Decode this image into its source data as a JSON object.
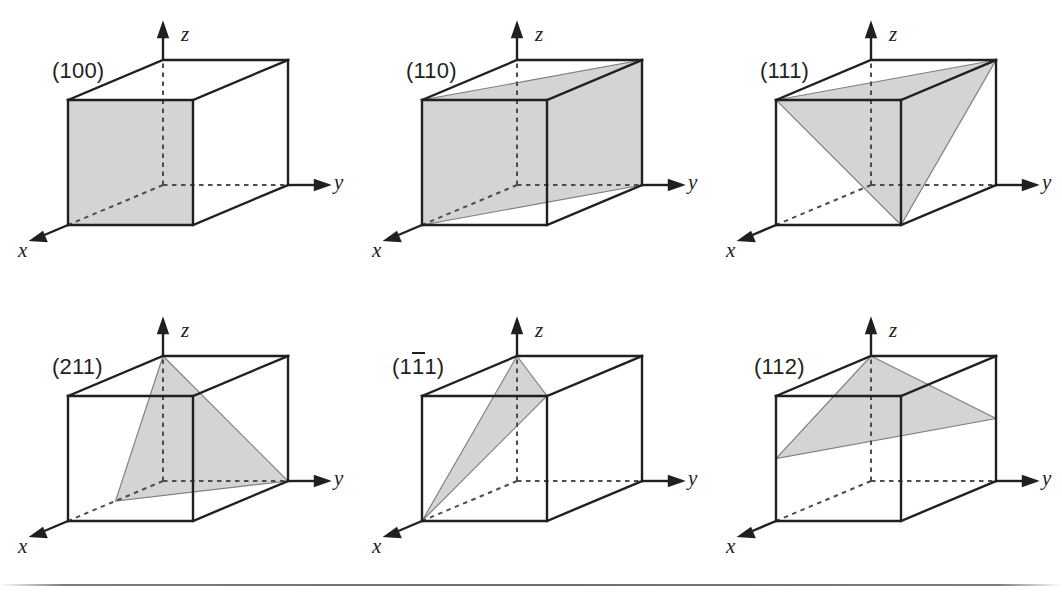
{
  "figure": {
    "geometry": {
      "cube_edge_px": 125,
      "depth_dx_px": 95,
      "depth_dy_px": -40,
      "line_color": "#231f20",
      "plane_fill": "#d4d4d4",
      "plane_stroke": "#808080",
      "dash_color": "#4d4d4d",
      "rule_color": "#6e6e6e"
    },
    "axes": {
      "x_label": "x",
      "y_label": "y",
      "z_label": "z"
    },
    "cells": [
      {
        "id": "cell-100",
        "index_label": "(100)",
        "index_pre": "(1",
        "index_bar": "",
        "index_post": "00)",
        "has_overbar": false,
        "plane_type": "square-face",
        "description": "Shaded front face of the cube intercepting the x axis at a"
      },
      {
        "id": "cell-110",
        "index_label": "(110)",
        "index_pre": "(1",
        "index_bar": "",
        "index_post": "10)",
        "has_overbar": false,
        "plane_type": "diagonal-parallelogram",
        "description": "Shaded diagonal plane intercepting x at a and y at a, parallel to z"
      },
      {
        "id": "cell-111",
        "index_label": "(111)",
        "index_pre": "(1",
        "index_bar": "",
        "index_post": "11)",
        "has_overbar": false,
        "plane_type": "triangle",
        "description": "Shaded triangle intercepting x, y and z each at a"
      },
      {
        "id": "cell-211",
        "index_label": "(211)",
        "index_pre": "(2",
        "index_bar": "",
        "index_post": "11)",
        "has_overbar": false,
        "plane_type": "triangle",
        "description": "Shaded triangle intercepting x at a/2, y at a and z at a"
      },
      {
        "id": "cell-1b11",
        "index_label": "(1̅1̅1)",
        "index_pre": "(1",
        "index_bar": "1",
        "index_post": "1)",
        "has_overbar": true,
        "description": "Shaded narrow triangle intercepting x at a, y at -a and z at a",
        "plane_type": "triangle"
      },
      {
        "id": "cell-112",
        "index_label": "(112)",
        "index_pre": "(1",
        "index_bar": "",
        "index_post": "12)",
        "has_overbar": false,
        "plane_type": "triangle",
        "description": "Shaded triangle intercepting x at a, y at a and z at a/2"
      }
    ]
  }
}
